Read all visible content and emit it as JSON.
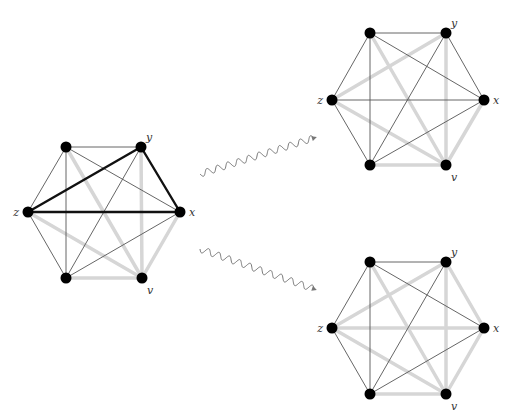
{
  "styles": {
    "thin": {
      "color": "#555555",
      "width": 0.9
    },
    "gray": {
      "color": "#d6d6d6",
      "width": 3.5
    },
    "black": {
      "color": "#111111",
      "width": 2.4
    },
    "node_color": "#000000",
    "node_radius": 5.5
  },
  "graphs": [
    {
      "name": "source-graph",
      "nodes": {
        "A": {
          "x": 66,
          "y": 147,
          "label": ""
        },
        "Y": {
          "x": 141,
          "y": 147,
          "label": "y"
        },
        "X": {
          "x": 180,
          "y": 212,
          "label": "x"
        },
        "V": {
          "x": 142,
          "y": 278,
          "label": "v"
        },
        "B": {
          "x": 66,
          "y": 278,
          "label": ""
        },
        "Z": {
          "x": 28,
          "y": 212,
          "label": "z"
        }
      },
      "edges": [
        [
          "A",
          "Y",
          "thin"
        ],
        [
          "A",
          "Z",
          "thin"
        ],
        [
          "A",
          "X",
          "thin"
        ],
        [
          "A",
          "B",
          "thin"
        ],
        [
          "Z",
          "B",
          "thin"
        ],
        [
          "Y",
          "B",
          "thin"
        ],
        [
          "B",
          "X",
          "thin"
        ],
        [
          "A",
          "V",
          "gray"
        ],
        [
          "Z",
          "V",
          "gray"
        ],
        [
          "B",
          "V",
          "gray"
        ],
        [
          "Y",
          "V",
          "gray"
        ],
        [
          "X",
          "V",
          "gray"
        ],
        [
          "Z",
          "Y",
          "black"
        ],
        [
          "Y",
          "X",
          "black"
        ],
        [
          "Z",
          "X",
          "black"
        ]
      ]
    },
    {
      "name": "result-graph-top",
      "nodes": {
        "A": {
          "x": 370,
          "y": 33,
          "label": ""
        },
        "Y": {
          "x": 446,
          "y": 33,
          "label": "y"
        },
        "X": {
          "x": 484,
          "y": 100,
          "label": "x"
        },
        "V": {
          "x": 446,
          "y": 165,
          "label": "v"
        },
        "B": {
          "x": 370,
          "y": 165,
          "label": ""
        },
        "Z": {
          "x": 332,
          "y": 100,
          "label": "z"
        }
      },
      "edges": [
        [
          "A",
          "Y",
          "thin"
        ],
        [
          "A",
          "Z",
          "thin"
        ],
        [
          "A",
          "X",
          "thin"
        ],
        [
          "A",
          "B",
          "thin"
        ],
        [
          "Y",
          "X",
          "thin"
        ],
        [
          "Y",
          "B",
          "thin"
        ],
        [
          "Z",
          "X",
          "thin"
        ],
        [
          "Z",
          "B",
          "thin"
        ],
        [
          "B",
          "X",
          "thin"
        ],
        [
          "Z",
          "Y",
          "gray"
        ],
        [
          "A",
          "V",
          "gray"
        ],
        [
          "Z",
          "V",
          "gray"
        ],
        [
          "Y",
          "V",
          "gray"
        ],
        [
          "X",
          "V",
          "gray"
        ],
        [
          "B",
          "V",
          "gray"
        ]
      ]
    },
    {
      "name": "result-graph-bottom",
      "nodes": {
        "A": {
          "x": 370,
          "y": 262,
          "label": ""
        },
        "Y": {
          "x": 446,
          "y": 262,
          "label": "y"
        },
        "X": {
          "x": 484,
          "y": 328,
          "label": "x"
        },
        "V": {
          "x": 446,
          "y": 394,
          "label": "v"
        },
        "B": {
          "x": 370,
          "y": 394,
          "label": ""
        },
        "Z": {
          "x": 332,
          "y": 328,
          "label": "z"
        }
      },
      "edges": [
        [
          "A",
          "Y",
          "thin"
        ],
        [
          "A",
          "Z",
          "thin"
        ],
        [
          "A",
          "X",
          "thin"
        ],
        [
          "A",
          "B",
          "thin"
        ],
        [
          "Y",
          "B",
          "thin"
        ],
        [
          "Z",
          "B",
          "thin"
        ],
        [
          "B",
          "X",
          "thin"
        ],
        [
          "Z",
          "Y",
          "gray"
        ],
        [
          "A",
          "V",
          "gray"
        ],
        [
          "Z",
          "V",
          "gray"
        ],
        [
          "Y",
          "V",
          "gray"
        ],
        [
          "X",
          "V",
          "gray"
        ],
        [
          "B",
          "V",
          "gray"
        ],
        [
          "Z",
          "X",
          "gray"
        ],
        [
          "Y",
          "X",
          "gray"
        ]
      ]
    }
  ],
  "arrows": [
    {
      "name": "wavy-arrow-up",
      "from": [
        200,
        174
      ],
      "to": [
        314,
        138
      ]
    },
    {
      "name": "wavy-arrow-down",
      "from": [
        200,
        249
      ],
      "to": [
        314,
        289
      ]
    }
  ]
}
